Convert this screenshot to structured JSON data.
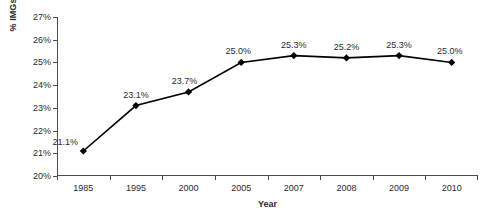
{
  "chart_data": {
    "type": "line",
    "title": "",
    "xlabel": "Year",
    "ylabel": "% IMGs",
    "categories": [
      "1985",
      "1995",
      "2000",
      "2005",
      "2007",
      "2008",
      "2009",
      "2010"
    ],
    "values": [
      21.1,
      23.1,
      23.7,
      25.0,
      25.3,
      25.2,
      25.3,
      25.0
    ],
    "point_labels": [
      "21.1%",
      "23.1%",
      "23.7%",
      "25.0%",
      "25.3%",
      "25.2%",
      "25.3%",
      "25.0%"
    ],
    "ylim": [
      20,
      27
    ],
    "ytick_values": [
      20,
      21,
      22,
      23,
      24,
      25,
      26,
      27
    ],
    "ytick_labels": [
      "20%",
      "21%",
      "22%",
      "23%",
      "24%",
      "25%",
      "26%",
      "27%"
    ],
    "grid": false,
    "legend": "none",
    "series_color": "#000000",
    "marker": "diamond",
    "axis_color": "#4d4d4d",
    "background": "#ffffff",
    "label_offsets": [
      {
        "dx": -18,
        "dy": -13
      },
      {
        "dx": 0,
        "dy": -15
      },
      {
        "dx": -4,
        "dy": -15
      },
      {
        "dx": -3,
        "dy": -15
      },
      {
        "dx": 0,
        "dy": -15
      },
      {
        "dx": 0,
        "dy": -15
      },
      {
        "dx": 0,
        "dy": -15
      },
      {
        "dx": -2,
        "dy": -15
      }
    ]
  }
}
